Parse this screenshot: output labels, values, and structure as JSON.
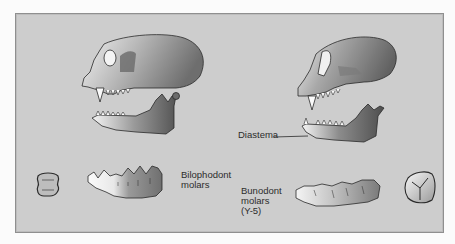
{
  "figure": {
    "title": "",
    "background_color": "#cdcdcd",
    "left_column": {
      "subject": "monkey-skull-and-mandible",
      "molar_label_line1": "Bilophodont",
      "molar_label_line2": "molars"
    },
    "right_column": {
      "subject": "ape-skull-and-mandible",
      "diastema_label": "Diastema",
      "molar_label_line1": "Bunodont",
      "molar_label_line2": "molars",
      "molar_label_line3": "(Y-5)"
    }
  }
}
